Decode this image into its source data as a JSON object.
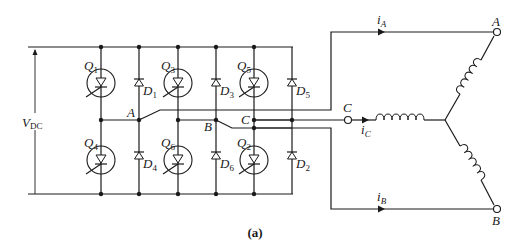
{
  "diagram": {
    "caption": "(a)",
    "supply": {
      "label_main": "V",
      "label_sub": "DC"
    },
    "transistors": [
      {
        "id": "Q1",
        "main": "Q",
        "sub": "1"
      },
      {
        "id": "Q3",
        "main": "Q",
        "sub": "3"
      },
      {
        "id": "Q5",
        "main": "Q",
        "sub": "5"
      },
      {
        "id": "Q4",
        "main": "Q",
        "sub": "4"
      },
      {
        "id": "Q6",
        "main": "Q",
        "sub": "6"
      },
      {
        "id": "Q2",
        "main": "Q",
        "sub": "2"
      }
    ],
    "diodes": [
      {
        "id": "D1",
        "main": "D",
        "sub": "1"
      },
      {
        "id": "D3",
        "main": "D",
        "sub": "3"
      },
      {
        "id": "D5",
        "main": "D",
        "sub": "5"
      },
      {
        "id": "D4",
        "main": "D",
        "sub": "4"
      },
      {
        "id": "D6",
        "main": "D",
        "sub": "6"
      },
      {
        "id": "D2",
        "main": "D",
        "sub": "2"
      }
    ],
    "nodes": {
      "a": "A",
      "b": "B",
      "c": "C"
    },
    "currents": [
      {
        "id": "iA",
        "main": "i",
        "sub": "A"
      },
      {
        "id": "iB",
        "main": "i",
        "sub": "B"
      },
      {
        "id": "iC",
        "main": "i",
        "sub": "C"
      }
    ],
    "terminals": {
      "a": "A",
      "b": "B",
      "c": "C"
    }
  }
}
